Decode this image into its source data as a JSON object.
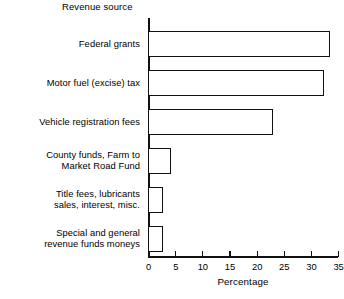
{
  "chart_data": {
    "type": "bar",
    "orientation": "horizontal",
    "title": "Revenue source",
    "xlabel": "Percentage",
    "ylabel": "Revenue source",
    "grid": false,
    "legend": false,
    "xlim": [
      0,
      35
    ],
    "xticks": [
      0,
      5,
      10,
      15,
      20,
      25,
      30,
      35
    ],
    "xtick_labels": [
      "0",
      "5",
      "10",
      "15",
      "20",
      "25",
      "30",
      "35"
    ],
    "categories": [
      "Federal grants",
      "Motor fuel (excise) tax",
      "Vehicle registration fees",
      "County funds, Farm to\nMarket Road Fund",
      "Title fees, lubricants\nsales, interest, misc.",
      "Special and general\nrevenue funds moneys"
    ],
    "values": [
      33.5,
      32.5,
      23,
      4.3,
      2.7,
      2.7
    ],
    "bar_face_color": "#ffffff",
    "bar_edge_color": "#111111"
  },
  "colors": {
    "background": "#ffffff",
    "ink": "#111111"
  }
}
